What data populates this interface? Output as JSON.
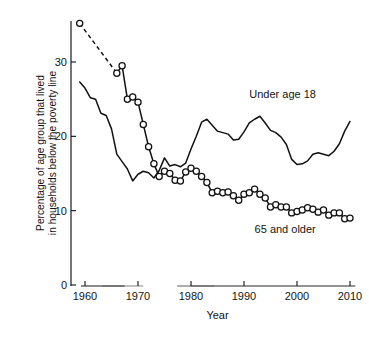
{
  "chart_data": {
    "type": "line",
    "title": "",
    "xlabel": "Year",
    "ylabel": "Percentage of age group that lived in households below the poverty line",
    "ylabel_line1": "Percentage of age group that lived",
    "ylabel_line2": "in households below the poverty line",
    "xlim": [
      1958.0,
      2011.0
    ],
    "ylim": [
      0,
      35.8
    ],
    "grid": false,
    "legend_position": "inline-annotations",
    "x_ticks": [
      1960,
      1970,
      1980,
      1990,
      2000,
      2010
    ],
    "x_tick_labels": [
      "1960",
      "1970",
      "1980",
      "1990",
      "2000",
      "2010"
    ],
    "y_ticks": [
      0,
      10,
      20,
      30
    ],
    "y_tick_labels": [
      "0",
      "10",
      "20",
      "30"
    ],
    "annotations": [
      {
        "text": "Under age 18",
        "x": 1991,
        "y": 25.2
      },
      {
        "text": "65 and older",
        "x": 1992,
        "y": 7.0
      }
    ],
    "series": [
      {
        "name": "65 and older",
        "label": "65 and older",
        "markers": "open-circle",
        "color": "#111111",
        "has_dashed_gap": true,
        "dashed_gap_from": 1959,
        "dashed_gap_to": 1966,
        "x": [
          1959,
          1966,
          1967,
          1968,
          1969,
          1970,
          1971,
          1972,
          1973,
          1974,
          1975,
          1976,
          1977,
          1978,
          1979,
          1980,
          1981,
          1982,
          1983,
          1984,
          1985,
          1986,
          1987,
          1988,
          1989,
          1990,
          1991,
          1992,
          1993,
          1994,
          1995,
          1996,
          1997,
          1998,
          1999,
          2000,
          2001,
          2002,
          2003,
          2004,
          2005,
          2006,
          2007,
          2008,
          2009,
          2010
        ],
        "y": [
          35.2,
          28.5,
          29.5,
          25.0,
          25.3,
          24.6,
          21.6,
          18.6,
          16.3,
          14.6,
          15.3,
          15.0,
          14.1,
          14.0,
          15.2,
          15.7,
          15.3,
          14.6,
          13.8,
          12.4,
          12.6,
          12.4,
          12.5,
          12.0,
          11.4,
          12.2,
          12.4,
          12.9,
          12.2,
          11.7,
          10.5,
          10.8,
          10.5,
          10.5,
          9.7,
          9.9,
          10.1,
          10.4,
          10.2,
          9.8,
          10.1,
          9.4,
          9.7,
          9.7,
          8.9,
          9.0
        ]
      },
      {
        "name": "Under age 18",
        "label": "Under age 18",
        "markers": "none",
        "color": "#111111",
        "has_dashed_gap": false,
        "x": [
          1959,
          1960,
          1961,
          1962,
          1963,
          1964,
          1965,
          1966,
          1967,
          1968,
          1969,
          1970,
          1971,
          1972,
          1973,
          1974,
          1975,
          1976,
          1977,
          1978,
          1979,
          1980,
          1981,
          1982,
          1983,
          1984,
          1985,
          1986,
          1987,
          1988,
          1989,
          1990,
          1991,
          1992,
          1993,
          1994,
          1995,
          1996,
          1997,
          1998,
          1999,
          2000,
          2001,
          2002,
          2003,
          2004,
          2005,
          2006,
          2007,
          2008,
          2009,
          2010
        ],
        "y": [
          27.3,
          26.5,
          25.2,
          25.0,
          23.1,
          22.8,
          21.0,
          17.6,
          16.6,
          15.6,
          14.0,
          14.9,
          15.3,
          15.1,
          14.4,
          15.4,
          17.1,
          16.0,
          16.2,
          15.9,
          16.4,
          18.3,
          20.0,
          21.9,
          22.3,
          21.5,
          20.7,
          20.5,
          20.3,
          19.5,
          19.6,
          20.6,
          21.8,
          22.3,
          22.7,
          21.8,
          20.8,
          20.5,
          19.9,
          18.9,
          16.9,
          16.2,
          16.3,
          16.7,
          17.6,
          17.8,
          17.6,
          17.4,
          18.0,
          19.0,
          20.7,
          22.0
        ]
      }
    ]
  },
  "figure": {
    "caption_fragment": ""
  }
}
